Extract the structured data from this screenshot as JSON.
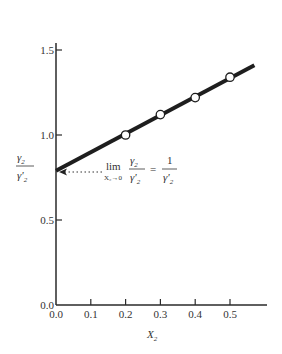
{
  "chart_data": {
    "type": "line",
    "title": "",
    "xlabel": "X2",
    "ylabel": "γ2 / γ'2",
    "xlim": [
      0.0,
      0.6
    ],
    "ylim": [
      0.0,
      1.7
    ],
    "x_ticks": [
      0.0,
      0.1,
      0.2,
      0.3,
      0.4,
      0.5
    ],
    "x_tick_labels": [
      "0.0",
      "0.1",
      "0.2",
      "0.3",
      "0.4",
      "0.5"
    ],
    "y_ticks": [
      0.0,
      0.5,
      1.0,
      1.5
    ],
    "y_tick_labels": [
      "0.0",
      "0.5",
      "1.0",
      "1.5"
    ],
    "grid": false,
    "legend": null,
    "series": [
      {
        "name": "data points",
        "style": "open-circle markers",
        "x": [
          0.2,
          0.3,
          0.4,
          0.5
        ],
        "y": [
          1.0,
          1.12,
          1.22,
          1.34
        ]
      },
      {
        "name": "fitted line",
        "style": "thick solid line",
        "x": [
          0.0,
          0.57
        ],
        "y": [
          0.79,
          1.41
        ]
      }
    ],
    "annotations": [
      {
        "text": "lim(X2→0) γ2/γ'2 = 1/γ'2",
        "arrow_to": {
          "x": 0.0,
          "y": 0.79
        },
        "arrow_style": "dotted"
      }
    ]
  },
  "labels": {
    "x_axis_main": "X",
    "x_axis_sub": "2",
    "y_axis_num": "γ",
    "y_axis_num_sub": "2",
    "y_axis_den": "γ'",
    "y_axis_den_sub": "2",
    "annot_lim": "lim",
    "annot_lim_sub": "X₂→0",
    "annot_frac_num": "γ",
    "annot_frac_num_sub": "2",
    "annot_frac_den": "γ'",
    "annot_frac_den_sub": "2",
    "annot_eq": "=",
    "annot_rhs_num": "1",
    "annot_rhs_den": "γ'",
    "annot_rhs_den_sub": "2"
  },
  "colors": {
    "axis": "#2a2a2a",
    "line": "#1e1e1e",
    "marker_fill": "#ffffff"
  }
}
